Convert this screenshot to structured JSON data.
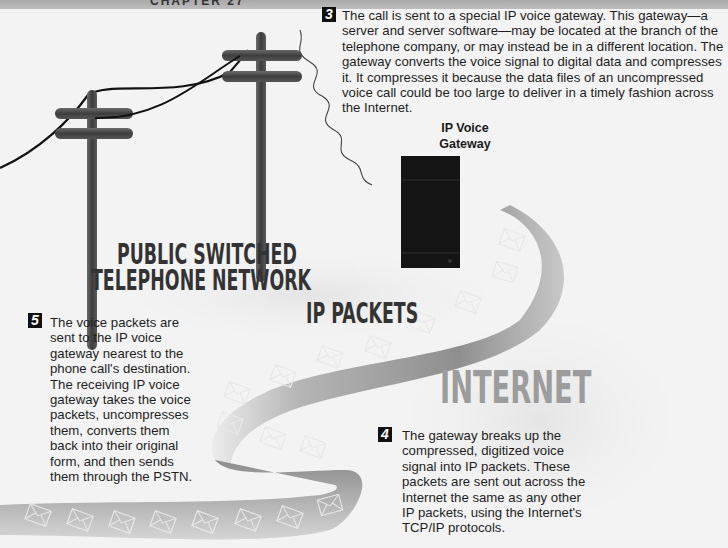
{
  "header": {
    "partial_title": "CHAPTER 27"
  },
  "labels": {
    "pstn_line1": "PUBLIC SWITCHED",
    "pstn_line2": "TELEPHONE NETWORK",
    "ip_packets": "IP PACKETS",
    "internet": "INTERNET",
    "gateway_line1": "IP Voice",
    "gateway_line2": "Gateway"
  },
  "steps": [
    {
      "number": "3",
      "text": "The call is sent to a special IP voice gateway. This gateway—a server and server software—may be located at the branch of the telephone company, or may instead be in a different location. The gateway converts the voice signal to digital data and compresses it. It compresses it because the data files of an uncompressed voice call could be too large to deliver in a timely fashion across the Internet."
    },
    {
      "number": "4",
      "text": "The gateway breaks up the compressed, digitized voice signal into IP packets. These packets are sent out across the Internet the same as any other IP packets, using the Internet's TCP/IP protocols."
    },
    {
      "number": "5",
      "text": "The voice packets are sent to the IP voice gateway nearest to the phone call's destination. The receiving IP voice gateway takes the voice packets, uncompresses them, converts them back into their original form, and then sends them through the PSTN."
    }
  ],
  "icons": {
    "packet": "envelope-icon",
    "pole": "telephone-pole",
    "server": "gateway-server"
  },
  "colors": {
    "background": "#f3f3f3",
    "ribbon": "#9a9a9a",
    "pole": "#4a4a4a",
    "server": "#141414",
    "internet_text": "#9c9c9c"
  }
}
